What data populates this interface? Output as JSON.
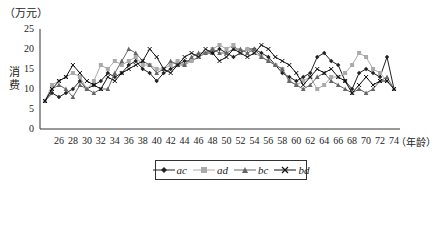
{
  "chart_data": {
    "type": "line",
    "title": "",
    "y_unit": "（万元）",
    "ylabel": "消费",
    "xlabel": "（年龄）",
    "ylim": [
      0,
      25
    ],
    "yticks": [
      0,
      5,
      10,
      15,
      20,
      25
    ],
    "x_tick_labels": [
      "26",
      "28",
      "30",
      "32",
      "34",
      "36",
      "38",
      "40",
      "42",
      "44",
      "46",
      "48",
      "50",
      "52",
      "54",
      "56",
      "58",
      "60",
      "62",
      "64",
      "66",
      "68",
      "70",
      "72",
      "74"
    ],
    "x": [
      24,
      25,
      26,
      27,
      28,
      29,
      30,
      31,
      32,
      33,
      34,
      35,
      36,
      37,
      38,
      39,
      40,
      41,
      42,
      43,
      44,
      45,
      46,
      47,
      48,
      49,
      50,
      51,
      52,
      53,
      54,
      55,
      56,
      57,
      58,
      59,
      60,
      61,
      62,
      63,
      64,
      65,
      66,
      67,
      68,
      69,
      70,
      71,
      72,
      73,
      74
    ],
    "grid": false,
    "legend_position": "bottom",
    "series": [
      {
        "name": "ac",
        "marker": "diamond",
        "color": "#222222",
        "values": [
          7,
          9,
          8,
          9,
          10,
          12,
          10,
          11,
          12,
          14,
          13,
          14,
          16,
          17,
          15,
          14,
          12,
          14,
          15,
          16,
          17,
          17,
          18,
          19,
          19,
          20,
          19,
          18,
          19,
          20,
          20,
          19,
          18,
          16,
          14,
          13,
          12,
          13,
          14,
          18,
          19,
          17,
          16,
          12,
          10,
          14,
          15,
          14,
          13,
          18,
          10
        ]
      },
      {
        "name": "ad",
        "marker": "square",
        "color": "#aaaaaa",
        "values": [
          7,
          11,
          12,
          13,
          14,
          13,
          10,
          12,
          16,
          15,
          17,
          16,
          17,
          18,
          16,
          16,
          15,
          15,
          16,
          17,
          16,
          17,
          18,
          19,
          20,
          21,
          20,
          21,
          19,
          20,
          19,
          18,
          17,
          16,
          15,
          12,
          11,
          12,
          13,
          10,
          11,
          13,
          13,
          14,
          16,
          19,
          18,
          15,
          14,
          12,
          10
        ]
      },
      {
        "name": "bc",
        "marker": "triangle",
        "color": "#666666",
        "values": [
          7,
          10,
          11,
          10,
          8,
          11,
          10,
          9,
          10,
          10,
          14,
          17,
          20,
          19,
          17,
          16,
          14,
          15,
          17,
          16,
          16,
          18,
          19,
          19,
          20,
          19,
          19,
          20,
          20,
          19,
          20,
          18,
          17,
          16,
          15,
          12,
          11,
          10,
          11,
          13,
          14,
          12,
          11,
          10,
          9,
          10,
          9,
          10,
          12,
          13,
          10
        ]
      },
      {
        "name": "bd",
        "marker": "x",
        "color": "#111111",
        "values": [
          7,
          10,
          12,
          13,
          16,
          14,
          12,
          11,
          10,
          13,
          12,
          14,
          15,
          16,
          17,
          20,
          18,
          15,
          14,
          16,
          18,
          19,
          18,
          20,
          19,
          17,
          18,
          20,
          19,
          18,
          19,
          21,
          20,
          18,
          17,
          16,
          14,
          11,
          13,
          15,
          14,
          15,
          13,
          12,
          9,
          11,
          13,
          11,
          12,
          12,
          10
        ]
      }
    ]
  }
}
